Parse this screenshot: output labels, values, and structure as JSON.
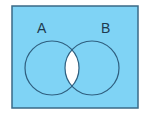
{
  "diagram": {
    "type": "venn",
    "shaded_region": "complement of A intersect B",
    "sets": [
      {
        "label": "A"
      },
      {
        "label": "B"
      }
    ],
    "colors": {
      "fill": "#7fd3f5",
      "stroke": "#2f5f7f",
      "intersection": "#ffffff",
      "label": "#1e3a4f"
    }
  }
}
